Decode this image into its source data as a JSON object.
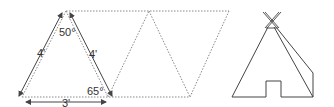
{
  "diagram": {
    "type": "teepee-pattern",
    "labels": {
      "left_side": "4'",
      "right_side": "4'",
      "base": "3'",
      "apex_angle": "50°",
      "base_angle": "65°"
    },
    "colors": {
      "dotted_line": "#888888",
      "solid_line": "#444444",
      "arrow": "#444444",
      "text": "#333333"
    },
    "pattern": {
      "description": "Flat layout of three triangles (two upright, one inverted) forming a parallelogram strip",
      "triangles": 3
    },
    "illustration": {
      "description": "Assembled teepee with crossed poles at top, door opening at base, and side flap"
    }
  }
}
